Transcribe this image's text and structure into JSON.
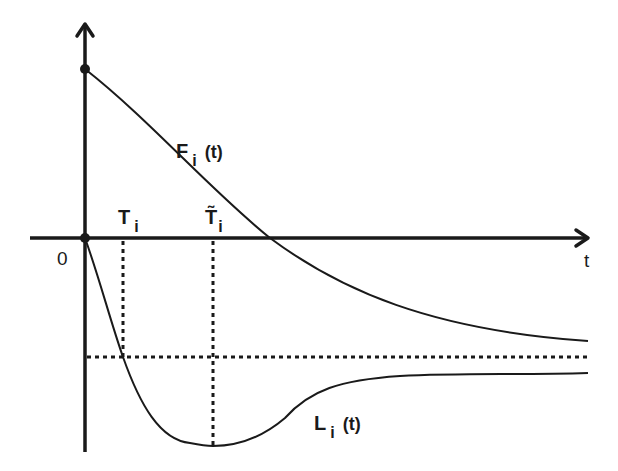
{
  "diagram": {
    "type": "function-curves-sketch",
    "colors": {
      "ink": "#1a1a1a",
      "background": "#ffffff"
    },
    "axes": {
      "origin_label": "0",
      "x_axis_label": "t"
    },
    "curves": [
      {
        "id": "F",
        "name": "F",
        "subscript": "i",
        "argument": "(t)",
        "description": "decreasing curve starting at positive value on y-axis, crossing t-axis, approaching a negative asymptote"
      },
      {
        "id": "L",
        "name": "L",
        "subscript": "i",
        "argument": "(t)",
        "description": "curve starting at origin, dipping to a minimum at T̃i, then rising toward a negative asymptote"
      }
    ],
    "markers": [
      {
        "id": "T",
        "name": "T",
        "subscript": "i",
        "description": "where L_i crosses the horizontal dashed level"
      },
      {
        "id": "T_tilde",
        "name": "T̃",
        "subscript": "i",
        "description": "time of minimum of L_i"
      }
    ],
    "points": [
      {
        "id": "F-start",
        "description": "F_i(0) on y-axis"
      },
      {
        "id": "origin",
        "description": "origin point"
      }
    ],
    "reference_lines": [
      {
        "id": "level",
        "orientation": "horizontal",
        "style": "dashed"
      },
      {
        "id": "T-drop",
        "orientation": "vertical",
        "style": "dashed"
      },
      {
        "id": "T-tilde-drop",
        "orientation": "vertical",
        "style": "dashed"
      }
    ]
  },
  "labels": {
    "origin": "0",
    "t_axis": "t",
    "F_curve": {
      "main": "F",
      "sub": "i",
      "arg": "(t)"
    },
    "L_curve": {
      "main": "L",
      "sub": "i",
      "arg": "(t)"
    },
    "T_marker": {
      "main": "T",
      "sub": "i"
    },
    "T_tilde_marker": {
      "main": "T̃",
      "sub": "i"
    }
  }
}
